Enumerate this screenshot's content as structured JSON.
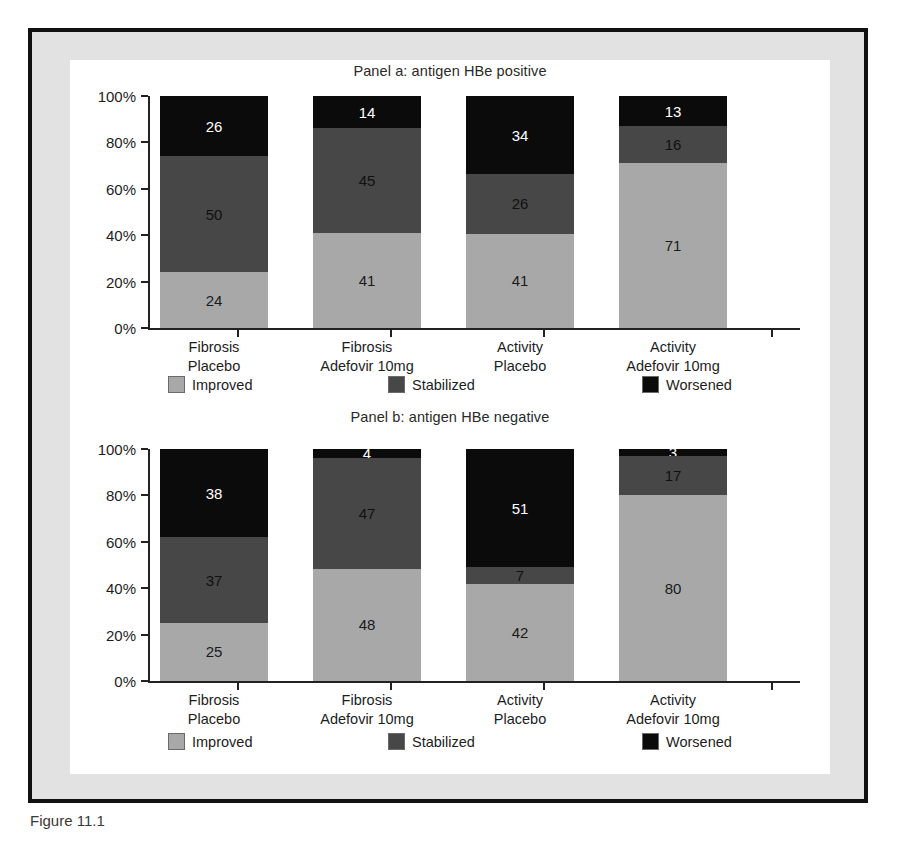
{
  "figure": {
    "caption_fragment": "Figure 11.1"
  },
  "legend": {
    "improved": "Improved",
    "stabilized": "Stabilized",
    "worsened": "Worsened"
  },
  "axis": {
    "ticks": [
      "100%",
      "80%",
      "60%",
      "40%",
      "20%",
      "0%"
    ]
  },
  "categories": [
    {
      "line1": "Fibrosis",
      "line2": "Placebo"
    },
    {
      "line1": "Fibrosis",
      "line2": "Adefovir 10mg"
    },
    {
      "line1": "Activity",
      "line2": "Placebo"
    },
    {
      "line1": "Activity",
      "line2": "Adefovir 10mg"
    }
  ],
  "chart_data": [
    {
      "type": "bar",
      "subtype": "stacked-100-percent",
      "title": "Panel a: antigen HBe positive",
      "xlabel": "",
      "ylabel": "",
      "ylim": [
        0,
        100
      ],
      "ytick_labels": [
        "0%",
        "20%",
        "40%",
        "60%",
        "80%",
        "100%"
      ],
      "grid": false,
      "legend_position": "bottom",
      "categories": [
        "Fibrosis Placebo",
        "Fibrosis Adefovir 10mg",
        "Activity Placebo",
        "Activity Adefovir 10mg"
      ],
      "series": [
        {
          "name": "Improved",
          "color": "#a8a8a8",
          "values": [
            24,
            41,
            41,
            71
          ]
        },
        {
          "name": "Stabilized",
          "color": "#474747",
          "values": [
            50,
            45,
            26,
            16
          ]
        },
        {
          "name": "Worsened",
          "color": "#0b0b0b",
          "values": [
            26,
            14,
            34,
            13
          ]
        }
      ]
    },
    {
      "type": "bar",
      "subtype": "stacked-100-percent",
      "title": "Panel b: antigen HBe negative",
      "xlabel": "",
      "ylabel": "",
      "ylim": [
        0,
        100
      ],
      "ytick_labels": [
        "0%",
        "20%",
        "40%",
        "60%",
        "80%",
        "100%"
      ],
      "grid": false,
      "legend_position": "bottom",
      "categories": [
        "Fibrosis Placebo",
        "Fibrosis Adefovir 10mg",
        "Activity Placebo",
        "Activity Adefovir 10mg"
      ],
      "series": [
        {
          "name": "Improved",
          "color": "#a8a8a8",
          "values": [
            25,
            48,
            42,
            80
          ]
        },
        {
          "name": "Stabilized",
          "color": "#474747",
          "values": [
            37,
            47,
            7,
            17
          ]
        },
        {
          "name": "Worsened",
          "color": "#0b0b0b",
          "values": [
            38,
            4,
            51,
            3
          ]
        }
      ]
    }
  ]
}
